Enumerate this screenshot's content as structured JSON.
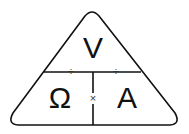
{
  "diagram": {
    "top": {
      "label": "V"
    },
    "bottom_left": {
      "label": "Ω"
    },
    "bottom_right": {
      "label": "A"
    },
    "operators": {
      "divide_left": "÷",
      "divide_right": "÷",
      "multiply": "×"
    },
    "colors": {
      "stroke": "#111111",
      "background": "#ffffff"
    }
  }
}
